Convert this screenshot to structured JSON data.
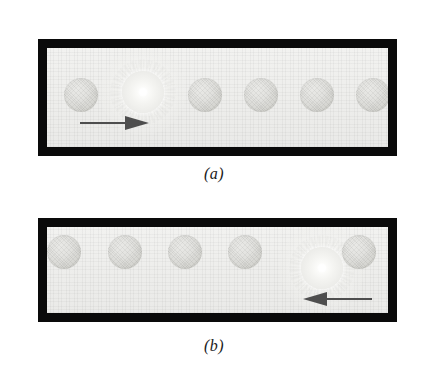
{
  "figure": {
    "type": "scientific-diagram",
    "background_color": "#ffffff"
  },
  "panels": [
    {
      "id": "panel-a",
      "caption": "(a)",
      "frame": {
        "border_color": "#0a0a0a",
        "fill_color": "#eeeeec",
        "x": 38,
        "y": 39,
        "width": 359,
        "height": 117,
        "border_width": 9
      },
      "spheres": [
        {
          "index": 1,
          "cx": 72,
          "cy": 95,
          "r": 17,
          "state": "ground",
          "color": "#ddddd9"
        },
        {
          "index": 2,
          "cx": 134,
          "cy": 92,
          "r": 20,
          "state": "excited",
          "color": "#ffffff"
        },
        {
          "index": 3,
          "cx": 196,
          "cy": 95,
          "r": 17,
          "state": "ground",
          "color": "#ddddd9"
        },
        {
          "index": 4,
          "cx": 252,
          "cy": 95,
          "r": 17,
          "state": "ground",
          "color": "#ddddd9"
        },
        {
          "index": 5,
          "cx": 308,
          "cy": 95,
          "r": 17,
          "state": "ground",
          "color": "#ddddd9"
        },
        {
          "index": 6,
          "cx": 364,
          "cy": 95,
          "r": 17,
          "state": "ground",
          "color": "#ddddd9"
        }
      ],
      "arrow": {
        "direction": "right",
        "color": "#4a4a4a",
        "x": 78,
        "y": 122,
        "length": 68,
        "label": "propagation-direction"
      }
    },
    {
      "id": "panel-b",
      "caption": "(b)",
      "frame": {
        "border_color": "#0a0a0a",
        "fill_color": "#eeeeec",
        "x": 38,
        "y": 218,
        "width": 359,
        "height": 104,
        "border_width": 9
      },
      "spheres": [
        {
          "index": 1,
          "cx": 72,
          "cy": 269,
          "r": 17,
          "state": "ground",
          "color": "#ddddd9"
        },
        {
          "index": 2,
          "cx": 133,
          "cy": 269,
          "r": 17,
          "state": "ground",
          "color": "#ddddd9"
        },
        {
          "index": 3,
          "cx": 193,
          "cy": 269,
          "r": 17,
          "state": "ground",
          "color": "#ddddd9"
        },
        {
          "index": 4,
          "cx": 253,
          "cy": 269,
          "r": 17,
          "state": "ground",
          "color": "#ddddd9"
        },
        {
          "index": 5,
          "cx": 313,
          "cy": 268,
          "r": 20,
          "state": "excited",
          "color": "#ffffff"
        },
        {
          "index": 6,
          "cx": 367,
          "cy": 269,
          "r": 17,
          "state": "ground",
          "color": "#ddddd9"
        }
      ],
      "arrow": {
        "direction": "left",
        "color": "#4a4a4a",
        "x": 300,
        "y": 297,
        "length": 68,
        "label": "propagation-direction"
      }
    }
  ],
  "captions": {
    "a": "(a)",
    "b": "(b)"
  }
}
